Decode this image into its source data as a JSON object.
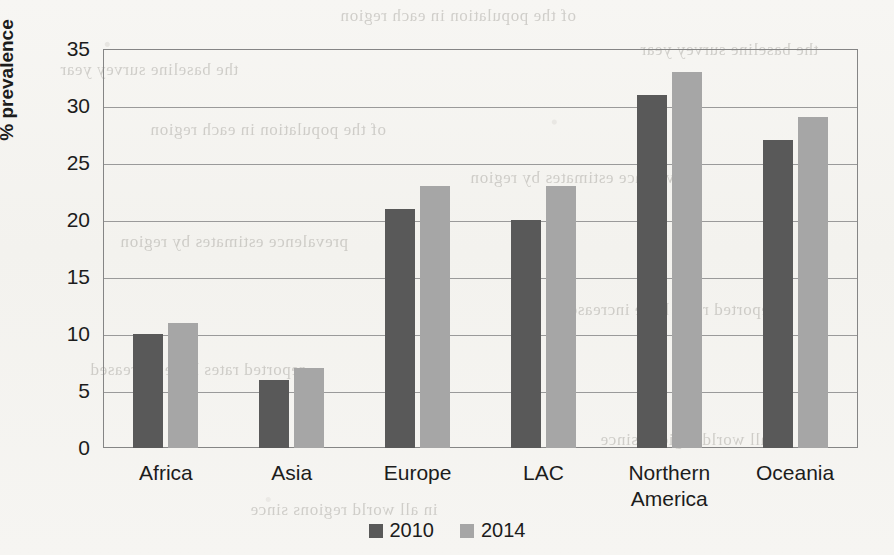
{
  "chart_data": {
    "type": "bar",
    "title": "",
    "xlabel": "",
    "ylabel": "% prevalence",
    "ylim": [
      0,
      35
    ],
    "yticks": [
      0,
      5,
      10,
      15,
      20,
      25,
      30,
      35
    ],
    "grid": true,
    "legend_position": "bottom",
    "categories": [
      "Africa",
      "Asia",
      "Europe",
      "LAC",
      "Northern\nAmerica",
      "Oceania"
    ],
    "series": [
      {
        "name": "2010",
        "color": "#595959",
        "values": [
          10,
          6,
          21,
          20,
          31,
          27
        ]
      },
      {
        "name": "2014",
        "color": "#a6a6a6",
        "values": [
          11,
          7,
          23,
          23,
          33,
          29
        ]
      }
    ]
  },
  "axis": {
    "y_title": "% prevalence",
    "y_tick_labels": [
      "35",
      "30",
      "25",
      "20",
      "15",
      "10",
      "5",
      "0"
    ],
    "x_tick_labels": [
      "Africa",
      "Asia",
      "Europe",
      "LAC",
      "Northern\nAmerica",
      "Oceania"
    ]
  },
  "legend": {
    "items": [
      {
        "label": "2010",
        "color": "#595959"
      },
      {
        "label": "2014",
        "color": "#a6a6a6"
      }
    ]
  },
  "page": {
    "background_color": "#f5f4f1",
    "bar_dark_color": "#595959",
    "bar_light_color": "#a6a6a6",
    "bleed_lines": [
      "of the population in each region",
      "prevalence estimates by region",
      "reported rates have increased",
      "in all world regions since",
      "the baseline survey year"
    ]
  }
}
